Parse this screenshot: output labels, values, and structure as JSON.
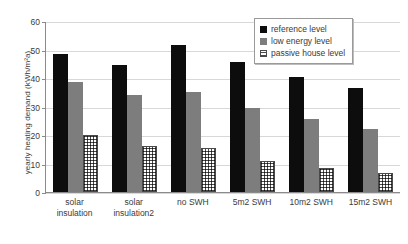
{
  "chart_data": {
    "type": "bar",
    "title": "",
    "xlabel": "",
    "ylabel": "yearly heating demand (kWh/m²a)",
    "ylim": [
      0,
      60
    ],
    "yticks": [
      0,
      10,
      20,
      30,
      40,
      50,
      60
    ],
    "grid": true,
    "legend_position": "top-right",
    "categories": [
      "solar\ninsulation",
      "solar\ninsulation2",
      "no SWH",
      "5m2 SWH",
      "10m2 SWH",
      "15m2 SWH"
    ],
    "series": [
      {
        "name": "reference level",
        "color": "#0d0d0d",
        "values": [
          48.5,
          44.5,
          51.5,
          45.5,
          40.5,
          36.5
        ]
      },
      {
        "name": "low energy level",
        "color": "#7d7d7d",
        "values": [
          38.5,
          34.0,
          35.0,
          29.5,
          25.5,
          22.0
        ]
      },
      {
        "name": "passive house level",
        "color": "#4a4a4a",
        "values": [
          20.0,
          16.0,
          15.5,
          11.0,
          8.5,
          6.5
        ]
      }
    ]
  }
}
